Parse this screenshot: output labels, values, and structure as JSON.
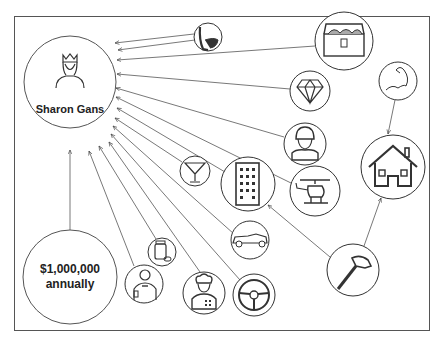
{
  "diagram": {
    "central_node": {
      "label": "Sharon Gans",
      "icon": "queen-icon"
    },
    "source_node": {
      "label_line1": "$1,000,000",
      "label_line2": "annually",
      "icon": "money-circle"
    },
    "nodes": [
      {
        "name": "toilet",
        "icon": "toilet-icon"
      },
      {
        "name": "treasure-chest",
        "icon": "treasure-chest-icon"
      },
      {
        "name": "diamond",
        "icon": "diamond-icon"
      },
      {
        "name": "bicep",
        "icon": "bicep-icon"
      },
      {
        "name": "worker",
        "icon": "worker-icon"
      },
      {
        "name": "house",
        "icon": "house-icon"
      },
      {
        "name": "cocktail",
        "icon": "cocktail-icon"
      },
      {
        "name": "building",
        "icon": "building-icon"
      },
      {
        "name": "helicopter",
        "icon": "helicopter-icon"
      },
      {
        "name": "car",
        "icon": "car-icon"
      },
      {
        "name": "medicine",
        "icon": "medicine-icon"
      },
      {
        "name": "hammer",
        "icon": "hammer-icon"
      },
      {
        "name": "waiter",
        "icon": "waiter-icon"
      },
      {
        "name": "chef",
        "icon": "chef-icon"
      },
      {
        "name": "steering-wheel",
        "icon": "steering-wheel-icon"
      }
    ],
    "edges": [
      {
        "from": "toilet",
        "to": "Sharon Gans"
      },
      {
        "from": "treasure-chest",
        "to": "Sharon Gans"
      },
      {
        "from": "diamond",
        "to": "Sharon Gans"
      },
      {
        "from": "worker",
        "to": "Sharon Gans"
      },
      {
        "from": "helicopter",
        "to": "Sharon Gans"
      },
      {
        "from": "cocktail",
        "to": "Sharon Gans"
      },
      {
        "from": "building",
        "to": "Sharon Gans"
      },
      {
        "from": "car",
        "to": "Sharon Gans"
      },
      {
        "from": "steering-wheel",
        "to": "Sharon Gans"
      },
      {
        "from": "chef",
        "to": "Sharon Gans"
      },
      {
        "from": "medicine",
        "to": "Sharon Gans"
      },
      {
        "from": "waiter",
        "to": "Sharon Gans"
      },
      {
        "from": "$1,000,000 annually",
        "to": "Sharon Gans"
      },
      {
        "from": "bicep",
        "to": "house"
      },
      {
        "from": "hammer",
        "to": "house"
      },
      {
        "from": "hammer",
        "to": "building"
      }
    ]
  }
}
